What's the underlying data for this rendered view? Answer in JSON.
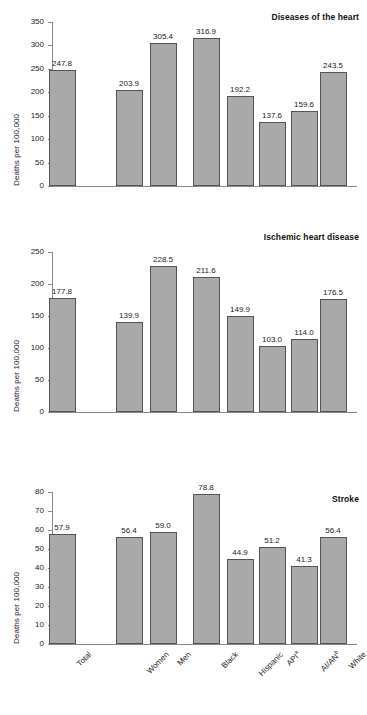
{
  "figure": {
    "ylabel": "Deaths per 100,000"
  },
  "chart_data": [
    {
      "type": "bar",
      "title": "Diseases of the heart",
      "xlabel": "",
      "ylabel": "Deaths per 100,000",
      "categories": [
        "Total",
        "Women",
        "Men",
        "Black",
        "Hispanic",
        "API",
        "AI/AN",
        "White"
      ],
      "category_notes": [
        "",
        "",
        "",
        "",
        "",
        "a",
        "b",
        ""
      ],
      "values": [
        247.8,
        203.9,
        305.4,
        316.9,
        192.2,
        137.6,
        159.6,
        243.5
      ],
      "value_labels": [
        "247.8",
        "203.9",
        "305.4",
        "316.9",
        "192.2",
        "137.6",
        "159.6",
        "243.5"
      ],
      "ylim": [
        0,
        350
      ],
      "yticks": [
        0,
        50,
        100,
        150,
        200,
        250,
        300,
        350
      ],
      "ytick_labels": [
        "0",
        "50",
        "100",
        "150",
        "200",
        "250",
        "300",
        "350"
      ],
      "grid": false,
      "legend": "none"
    },
    {
      "type": "bar",
      "title": "Ischemic heart disease",
      "xlabel": "",
      "ylabel": "Deaths per 100,000",
      "categories": [
        "Total",
        "Women",
        "Men",
        "Black",
        "Hispanic",
        "API",
        "AI/AN",
        "White"
      ],
      "category_notes": [
        "",
        "",
        "",
        "",
        "",
        "a",
        "b",
        ""
      ],
      "values": [
        177.8,
        139.9,
        228.5,
        211.6,
        149.9,
        103.0,
        114.0,
        176.5
      ],
      "value_labels": [
        "177.8",
        "139.9",
        "228.5",
        "211.6",
        "149.9",
        "103.0",
        "114.0",
        "176.5"
      ],
      "ylim": [
        0,
        250
      ],
      "yticks": [
        0,
        50,
        100,
        150,
        200,
        250
      ],
      "ytick_labels": [
        "0",
        "50",
        "100",
        "150",
        "200",
        "250"
      ],
      "grid": false,
      "legend": "none"
    },
    {
      "type": "bar",
      "title": "Stroke",
      "xlabel": "",
      "ylabel": "Deaths per 100,000",
      "categories": [
        "Total",
        "Women",
        "Men",
        "Black",
        "Hispanic",
        "API",
        "AI/AN",
        "White"
      ],
      "category_notes": [
        "",
        "",
        "",
        "",
        "",
        "a",
        "b",
        ""
      ],
      "values": [
        57.9,
        56.4,
        59.0,
        78.8,
        44.9,
        51.2,
        41.3,
        56.4
      ],
      "value_labels": [
        "57.9",
        "56.4",
        "59.0",
        "78.8",
        "44.9",
        "51.2",
        "41.3",
        "56.4"
      ],
      "ylim": [
        0,
        80
      ],
      "yticks": [
        0,
        10,
        20,
        30,
        40,
        50,
        60,
        70,
        80
      ],
      "ytick_labels": [
        "0",
        "10",
        "20",
        "30",
        "40",
        "50",
        "60",
        "70",
        "80"
      ],
      "grid": false,
      "legend": "none"
    }
  ],
  "xaxis": {
    "labels": [
      {
        "text": "Total",
        "note": ""
      },
      {
        "text": "Women",
        "note": ""
      },
      {
        "text": "Men",
        "note": ""
      },
      {
        "text": "Black",
        "note": ""
      },
      {
        "text": "Hispanic",
        "note": ""
      },
      {
        "text": "API",
        "note": "a"
      },
      {
        "text": "AI/AN",
        "note": "b"
      },
      {
        "text": "White",
        "note": ""
      }
    ]
  },
  "colors": {
    "bar_fill": "#a9a9a9",
    "bar_stroke": "#545454",
    "axis": "#8a8a8a",
    "text": "#1a1a1a",
    "background": "#ffffff"
  }
}
